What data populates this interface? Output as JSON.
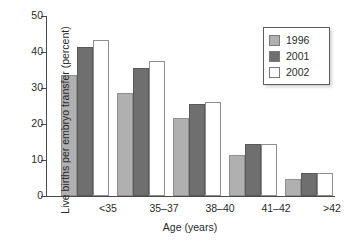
{
  "chart_data": {
    "type": "bar",
    "title": "",
    "xlabel": "Age (years)",
    "ylabel": "Live births per embryo transfer (percent)",
    "categories": [
      "<35",
      "35–37",
      "38–40",
      "41–42",
      ">42"
    ],
    "series": [
      {
        "name": "1996",
        "color": "#b0b0b0",
        "values": [
          33.6,
          28.7,
          21.7,
          11.3,
          4.8
        ]
      },
      {
        "name": "2001",
        "color": "#6f6f6f",
        "values": [
          41.4,
          35.6,
          25.6,
          14.5,
          6.3
        ]
      },
      {
        "name": "2002",
        "color": "#ffffff",
        "values": [
          43.4,
          37.6,
          26.2,
          14.4,
          6.3
        ]
      }
    ],
    "ylim": [
      0,
      50
    ],
    "yticks": [
      0,
      10,
      20,
      30,
      40,
      50
    ],
    "ytick_labels": [
      "0",
      "10",
      "20",
      "30",
      "40",
      "50"
    ],
    "grid": false,
    "legend_position": "top-right",
    "legend_entries": [
      "1996",
      "2001",
      "2002"
    ]
  }
}
